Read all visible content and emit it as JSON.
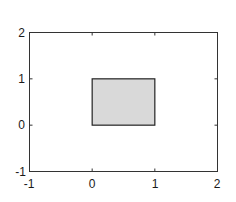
{
  "chart_data": {
    "type": "patch",
    "title": "",
    "xlabel": "",
    "ylabel": "",
    "xlim": [
      -1,
      2
    ],
    "ylim": [
      -1,
      2
    ],
    "xticks": [
      -1,
      0,
      1,
      2
    ],
    "yticks": [
      -1,
      0,
      1,
      2
    ],
    "xtick_labels": [
      "-1",
      "0",
      "1",
      "2"
    ],
    "ytick_labels": [
      "-1",
      "0",
      "1",
      "2"
    ],
    "grid": false,
    "legend": null,
    "shapes": [
      {
        "type": "rectangle",
        "x": [
          0,
          1,
          1,
          0
        ],
        "y": [
          0,
          0,
          1,
          1
        ],
        "fill_color": "#d9d9d9",
        "edge_color": "#000000"
      }
    ]
  },
  "colors": {
    "axes": "#333333",
    "rect_fill": "#d9d9d9",
    "rect_edge": "#222222",
    "background": "#ffffff"
  }
}
